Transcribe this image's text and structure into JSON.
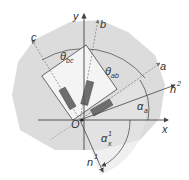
{
  "diagram": {
    "colors": {
      "region_fill": "#dcdcdc",
      "inner_fill": "#e9e9e9",
      "rect_fill": "#f4f4f4",
      "gauge_fill": "#6e6e6e",
      "line": "#444444",
      "dashed": "#777777"
    },
    "axes": {
      "x": {
        "label": "x"
      },
      "y": {
        "label": "y"
      },
      "origin": {
        "label": "O"
      }
    },
    "gauge_axes": {
      "a": {
        "label": "a"
      },
      "b": {
        "label": "b"
      },
      "c": {
        "label": "c"
      }
    },
    "normals": {
      "n1": {
        "label": "n",
        "superscript": "1"
      },
      "n2": {
        "label": "n",
        "superscript": "2"
      }
    },
    "angles": {
      "theta_ab": {
        "symbol": "θ",
        "subscript": "ab"
      },
      "theta_bc": {
        "symbol": "θ",
        "subscript": "bc"
      },
      "alpha_a": {
        "symbol": "α",
        "subscript": "a"
      },
      "alpha_x1": {
        "symbol": "α",
        "subscript": "x",
        "superscript": "1"
      }
    },
    "gauge_count": 3
  }
}
